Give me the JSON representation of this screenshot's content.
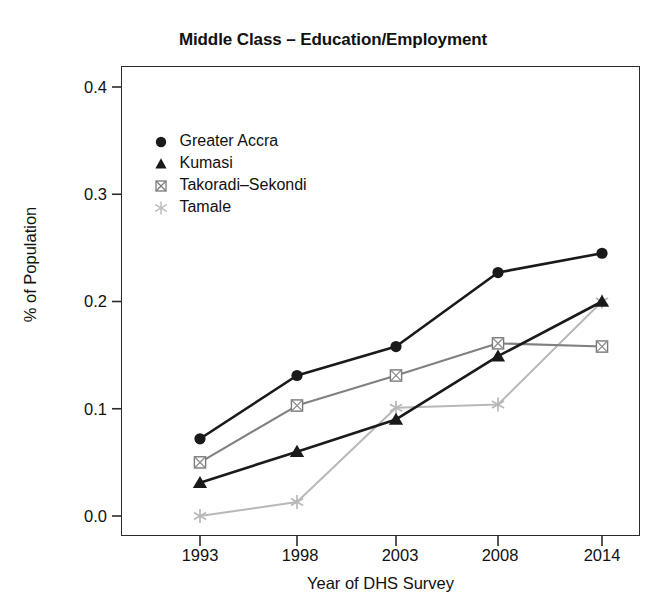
{
  "chart_data": {
    "type": "line",
    "title": "Middle Class – Education/Employment",
    "xlabel": "Year of DHS Survey",
    "ylabel": "% of Population",
    "categories": [
      "1993",
      "1998",
      "2003",
      "2008",
      "2014"
    ],
    "x": [
      1993,
      1998,
      2003,
      2008,
      2014
    ],
    "xtick_labels": [
      "1993",
      "1998",
      "2003",
      "2008",
      "2014"
    ],
    "ytick_labels": [
      "0.0",
      "0.1",
      "0.2",
      "0.3",
      "0.4"
    ],
    "yticks": [
      0.0,
      0.1,
      0.2,
      0.3,
      0.4
    ],
    "ylim": [
      -0.02,
      0.42
    ],
    "grid": false,
    "legend_position": "upper left inside",
    "series": [
      {
        "name": "Greater Accra",
        "marker": "filled-circle",
        "color": "#1a1a1a",
        "values": [
          0.072,
          0.131,
          0.158,
          0.227,
          0.245
        ]
      },
      {
        "name": "Kumasi",
        "marker": "filled-triangle",
        "color": "#1a1a1a",
        "values": [
          0.031,
          0.06,
          0.09,
          0.149,
          0.2
        ]
      },
      {
        "name": "Takoradi–Sekondi",
        "marker": "crossed-square",
        "color": "#808080",
        "values": [
          0.05,
          0.103,
          0.131,
          0.161,
          0.158
        ]
      },
      {
        "name": "Tamale",
        "marker": "asterisk",
        "color": "#b8b8b8",
        "values": [
          0.0,
          0.013,
          0.101,
          0.104,
          0.2
        ]
      }
    ]
  },
  "legend": {
    "entries": [
      {
        "label": "Greater Accra"
      },
      {
        "label": "Kumasi"
      },
      {
        "label": "Takoradi–Sekondi"
      },
      {
        "label": "Tamale"
      }
    ]
  },
  "axes": {
    "y_tick_0": "0.0",
    "y_tick_1": "0.1",
    "y_tick_2": "0.2",
    "y_tick_3": "0.3",
    "y_tick_4": "0.4",
    "x_tick_0": "1993",
    "x_tick_1": "1998",
    "x_tick_2": "2003",
    "x_tick_3": "2008",
    "x_tick_4": "2014"
  },
  "colors": {
    "axis": "#2b2b2b",
    "series_dark": "#1a1a1a",
    "series_mid": "#808080",
    "series_light": "#b8b8b8",
    "background": "#ffffff"
  }
}
